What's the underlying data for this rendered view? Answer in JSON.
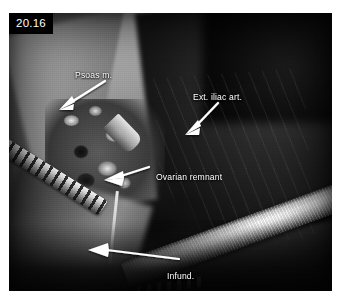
{
  "figure": {
    "number": "20.16"
  },
  "annotations": [
    {
      "id": "psoas-muscle",
      "label": "Psoas m.",
      "arrow": "points down-left from label toward upper-left muscle band"
    },
    {
      "id": "external-iliac-artery",
      "label": "Ext. iliac art.",
      "arrow": "points down-left from label toward central vessel"
    },
    {
      "id": "ovarian-remnant",
      "label": "Ovarian remnant",
      "arrow": "points left from label toward pale nodular tissue"
    },
    {
      "id": "infundibulopelvic-ligament",
      "label_line1": "Infund.",
      "label_line2": "pelvic lig.",
      "arrow": "long horizontal arrow pointing left toward lower-left pedicle"
    }
  ],
  "colors": {
    "label_text": "#ffffff",
    "badge_background": "#000000",
    "badge_text": "#ffffff",
    "page_background": "#ffffff"
  }
}
